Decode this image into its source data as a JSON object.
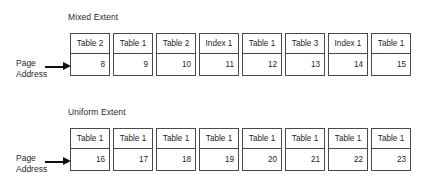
{
  "diagrams": [
    {
      "id": "mixed",
      "title": "Mixed Extent",
      "axis_label": {
        "line1": "Page",
        "line2": "Address",
        "arrow_icon": "arrow-right-icon"
      },
      "columns": [
        {
          "object": "Table 2",
          "address": "8"
        },
        {
          "object": "Table 1",
          "address": "9"
        },
        {
          "object": "Table 2",
          "address": "10"
        },
        {
          "object": "Index 1",
          "address": "11"
        },
        {
          "object": "Table 1",
          "address": "12"
        },
        {
          "object": "Table 3",
          "address": "13"
        },
        {
          "object": "Index 1",
          "address": "14"
        },
        {
          "object": "Table 1",
          "address": "15"
        }
      ]
    },
    {
      "id": "uniform",
      "title": "Uniform Extent",
      "axis_label": {
        "line1": "Page",
        "line2": "Address",
        "arrow_icon": "arrow-right-icon"
      },
      "columns": [
        {
          "object": "Table 1",
          "address": "16"
        },
        {
          "object": "Table 1",
          "address": "17"
        },
        {
          "object": "Table 1",
          "address": "18"
        },
        {
          "object": "Table 1",
          "address": "19"
        },
        {
          "object": "Table 1",
          "address": "20"
        },
        {
          "object": "Table 1",
          "address": "21"
        },
        {
          "object": "Table 1",
          "address": "22"
        },
        {
          "object": "Table 1",
          "address": "23"
        }
      ]
    }
  ],
  "colors": {
    "background": "#ffffff",
    "box_border": "#4a4a4a",
    "text": "#1f1f1f",
    "arrow": "#111111"
  }
}
